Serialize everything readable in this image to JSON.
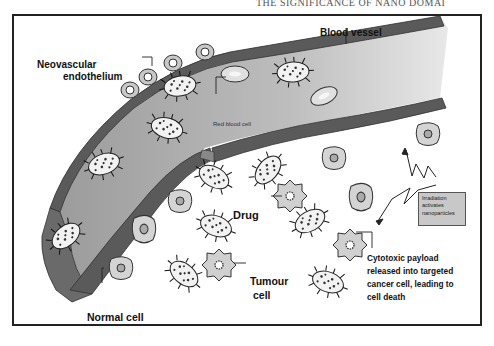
{
  "header": {
    "running_title": "THE SIGNIFICANCE OF NANO DOMAI"
  },
  "diagram": {
    "labels": {
      "blood_vessel": "Blood vessel",
      "neovascular_line1": "Neovascular",
      "neovascular_line2": "endothelium",
      "red_blood_cell": "Red blood cell",
      "drug": "Drug",
      "tumour_line1": "Tumour",
      "tumour_line2": "cell",
      "normal_cell": "Normal cell",
      "irradiation_line1": "Irradiation",
      "irradiation_line2": "activates",
      "irradiation_line3": "nanoparticles",
      "cytotoxic_line1": "Cytotoxic payload",
      "cytotoxic_line2": "released into targeted",
      "cytotoxic_line3": "cancer cell, leading to",
      "cytotoxic_line4": "cell death"
    },
    "colors": {
      "vessel_wall": "#5a5a5a",
      "vessel_lumen": "#b4b4b4",
      "cell_fill": "#d2d2d2",
      "frame": "#222222"
    }
  }
}
